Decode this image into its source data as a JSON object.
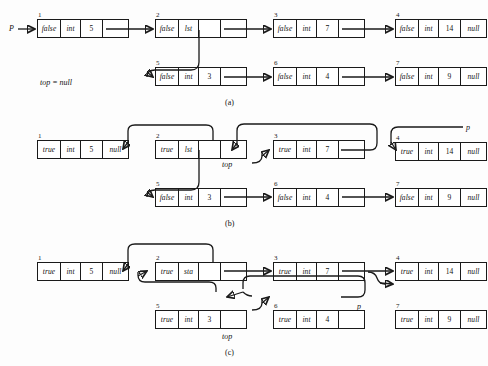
{
  "figure": {
    "panels": [
      {
        "caption": "(a)",
        "labels": {
          "p": "P",
          "top": "top = null"
        },
        "nodes": [
          {
            "num": "1",
            "flag": "false",
            "type": "int",
            "value": "5",
            "ptr": ""
          },
          {
            "num": "2",
            "flag": "false",
            "type": "lst",
            "value": "",
            "ptr": ""
          },
          {
            "num": "3",
            "flag": "false",
            "type": "int",
            "value": "7",
            "ptr": ""
          },
          {
            "num": "4",
            "flag": "false",
            "type": "int",
            "value": "14",
            "ptr": "null"
          },
          {
            "num": "5",
            "flag": "false",
            "type": "int",
            "value": "3",
            "ptr": ""
          },
          {
            "num": "6",
            "flag": "false",
            "type": "int",
            "value": "4",
            "ptr": ""
          },
          {
            "num": "7",
            "flag": "false",
            "type": "int",
            "value": "9",
            "ptr": "null"
          }
        ]
      },
      {
        "caption": "(b)",
        "labels": {
          "p": "p",
          "top": "top"
        },
        "nodes": [
          {
            "num": "1",
            "flag": "true",
            "type": "int",
            "value": "5",
            "ptr": "null"
          },
          {
            "num": "2",
            "flag": "true",
            "type": "lst",
            "value": "",
            "ptr": ""
          },
          {
            "num": "3",
            "flag": "true",
            "type": "int",
            "value": "7",
            "ptr": ""
          },
          {
            "num": "4",
            "flag": "true",
            "type": "int",
            "value": "14",
            "ptr": "null"
          },
          {
            "num": "5",
            "flag": "false",
            "type": "int",
            "value": "3",
            "ptr": ""
          },
          {
            "num": "6",
            "flag": "false",
            "type": "int",
            "value": "4",
            "ptr": ""
          },
          {
            "num": "7",
            "flag": "false",
            "type": "int",
            "value": "9",
            "ptr": "null"
          }
        ]
      },
      {
        "caption": "(c)",
        "labels": {
          "p": "p",
          "top": "top"
        },
        "nodes": [
          {
            "num": "1",
            "flag": "true",
            "type": "int",
            "value": "5",
            "ptr": "null"
          },
          {
            "num": "2",
            "flag": "true",
            "type": "sta",
            "value": "",
            "ptr": ""
          },
          {
            "num": "3",
            "flag": "true",
            "type": "int",
            "value": "7",
            "ptr": ""
          },
          {
            "num": "4",
            "flag": "true",
            "type": "int",
            "value": "14",
            "ptr": "null"
          },
          {
            "num": "5",
            "flag": "true",
            "type": "int",
            "value": "3",
            "ptr": ""
          },
          {
            "num": "6",
            "flag": "true",
            "type": "int",
            "value": "4",
            "ptr": ""
          },
          {
            "num": "7",
            "flag": "true",
            "type": "int",
            "value": "9",
            "ptr": "null"
          }
        ]
      }
    ],
    "colors": {
      "ink": "#1a1a1a",
      "paper": "#fdfdfd"
    }
  }
}
